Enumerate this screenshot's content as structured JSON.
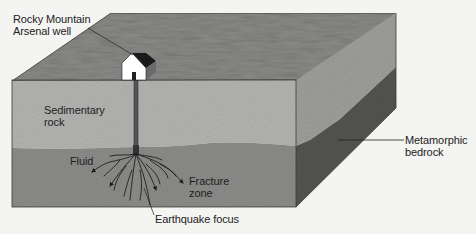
{
  "figure": {
    "cut_title_fragment": "Figure 8.x  Deep-well injection, Denver",
    "layers": [
      {
        "id": "surface",
        "name": "Ground surface",
        "color": "#8a8a88"
      },
      {
        "id": "sedimentary",
        "name": "Sedimentary rock",
        "color": "#b4b4b2"
      },
      {
        "id": "metamorphic",
        "name": "Metamorphic bedrock",
        "color": "#8c8c8a"
      },
      {
        "id": "metamorphic-side",
        "name": "Metamorphic bedrock (side)",
        "color": "#545452"
      }
    ],
    "labels": {
      "well": "Rocky Mountain\nArsenal well",
      "sedimentary": "Sedimentary\nrock",
      "fluid": "Fluid",
      "fracture": "Fracture\nzone",
      "focus": "Earthquake focus",
      "metamorphic": "Metamorphic\nbedrock"
    },
    "icons": {
      "well_house": "house-icon"
    }
  }
}
